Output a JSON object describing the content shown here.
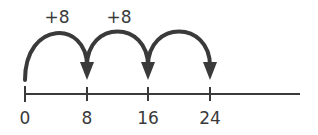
{
  "number_line": {
    "ticks": [
      {
        "value": "0",
        "x": 25
      },
      {
        "value": "8",
        "x": 87
      },
      {
        "value": "16",
        "x": 148
      },
      {
        "value": "24",
        "x": 210
      }
    ],
    "line_start_x": 25,
    "line_end_x": 300,
    "line_y": 94,
    "color": "#3a3a3a"
  },
  "jumps": [
    {
      "label": "+8",
      "from": "0",
      "to": "8"
    },
    {
      "label": "+8",
      "from": "8",
      "to": "16"
    },
    {
      "label": "",
      "from": "16",
      "to": "24"
    }
  ],
  "labels": {
    "tick_0": "0",
    "tick_1": "8",
    "tick_2": "16",
    "tick_3": "24",
    "jump_0": "+8",
    "jump_1": "+8"
  }
}
